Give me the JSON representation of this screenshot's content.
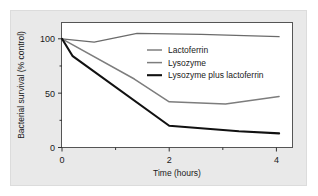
{
  "chart_data": {
    "type": "line",
    "title": "",
    "xlabel": "Time (hours)",
    "ylabel": "Bacterial survival (% control)",
    "xlim": [
      0,
      4.3
    ],
    "ylim": [
      0,
      115
    ],
    "grid": false,
    "legend_position": "inside-upper-right",
    "x_ticks": [
      0,
      2,
      4
    ],
    "x_tick_labels": [
      "0",
      "2",
      "4"
    ],
    "x_minor_ticks": [
      1,
      3
    ],
    "y_ticks": [
      0,
      50,
      100
    ],
    "y_tick_labels": [
      "0",
      "50",
      "100"
    ],
    "y_minor_ticks": [
      25,
      75
    ],
    "series": [
      {
        "name": "Lactoferrin",
        "color": "#6b6b6b",
        "width": 1.3,
        "x": [
          0,
          0.6,
          1.4,
          2.6,
          3.4,
          4.05
        ],
        "values": [
          100,
          97,
          105,
          104,
          103,
          102
        ]
      },
      {
        "name": "Lysozyme",
        "color": "#7d7d7d",
        "width": 1.5,
        "x": [
          0,
          1.35,
          2.0,
          3.05,
          4.05
        ],
        "values": [
          100,
          63,
          42,
          40,
          47
        ]
      },
      {
        "name": "Lysozyme plus lactoferrin",
        "color": "#111111",
        "width": 2.1,
        "x": [
          0,
          0.2,
          2.0,
          3.3,
          4.05
        ],
        "values": [
          100,
          84,
          20,
          15,
          13
        ]
      }
    ]
  },
  "legend": {
    "entries": [
      {
        "label": "Lactoferrin"
      },
      {
        "label": "Lysozyme"
      },
      {
        "label": "Lysozyme plus lactoferrin"
      }
    ]
  }
}
